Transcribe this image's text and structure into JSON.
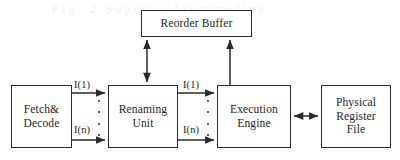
{
  "diagram": {
    "background_color": "#ffffff",
    "line_color": "#2a2a2a",
    "text_color": "#1e1e1e",
    "nodes": [
      {
        "id": "reorder-buffer",
        "label": "Reorder Buffer"
      },
      {
        "id": "fetch-decode",
        "label": "Fetch&\nDecode"
      },
      {
        "id": "renaming-unit",
        "label": "Renaming\nUnit"
      },
      {
        "id": "execution-engine",
        "label": "Execution\nEngine"
      },
      {
        "id": "physical-register-file",
        "label": "Physical\nRegister\nFile"
      }
    ],
    "edge_labels": {
      "fetch_to_renaming_first": "I(1)",
      "fetch_to_renaming_last": "I(n)",
      "renaming_to_execution_first": "I(1)",
      "renaming_to_execution_last": "I(n)"
    },
    "edges": [
      {
        "id": "fetch-to-renaming-top",
        "from": "fetch-decode",
        "to": "renaming-unit",
        "arrow": "single",
        "label": "I(1)"
      },
      {
        "id": "fetch-to-renaming-bottom",
        "from": "fetch-decode",
        "to": "renaming-unit",
        "arrow": "single",
        "label": "I(n)"
      },
      {
        "id": "renaming-to-execution-top",
        "from": "renaming-unit",
        "to": "execution-engine",
        "arrow": "single",
        "label": "I(1)"
      },
      {
        "id": "renaming-to-execution-bottom",
        "from": "renaming-unit",
        "to": "execution-engine",
        "arrow": "single",
        "label": "I(n)"
      },
      {
        "id": "renaming-to-reorder-buffer",
        "from": "renaming-unit",
        "to": "reorder-buffer",
        "arrow": "double",
        "label": ""
      },
      {
        "id": "execution-to-reorder-buffer",
        "from": "execution-engine",
        "to": "reorder-buffer",
        "arrow": "single",
        "label": ""
      },
      {
        "id": "execution-to-register-file",
        "from": "execution-engine",
        "to": "physical-register-file",
        "arrow": "double",
        "label": ""
      }
    ],
    "ellipsis_marker": "·",
    "ghost_watermark": "Fig. 2 Superscalar pipeline"
  }
}
